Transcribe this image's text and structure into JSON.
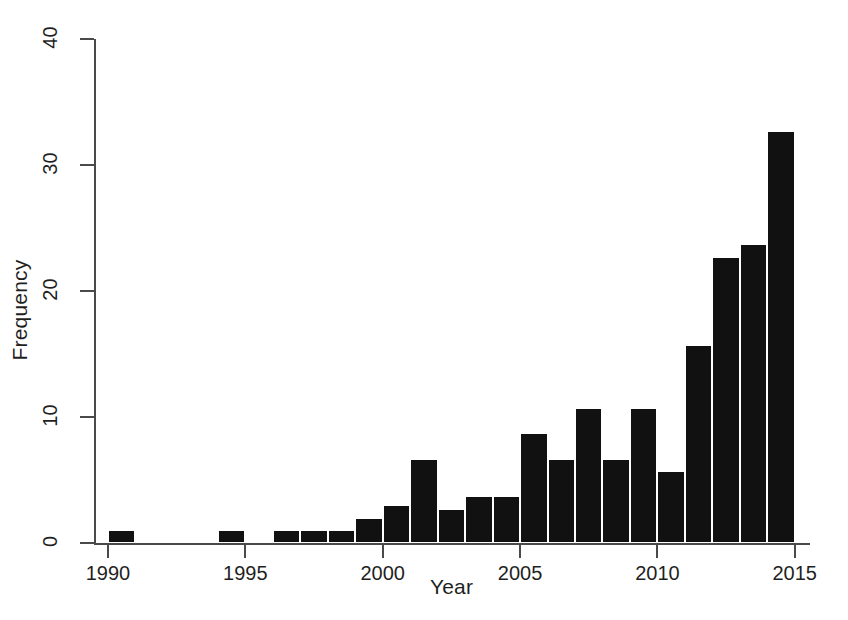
{
  "chart_data": {
    "type": "bar",
    "title": "",
    "xlabel": "Year",
    "ylabel": "Frequency",
    "categories": [
      1990,
      1991,
      1992,
      1993,
      1994,
      1995,
      1996,
      1997,
      1998,
      1999,
      2000,
      2001,
      2002,
      2003,
      2004,
      2005,
      2006,
      2007,
      2008,
      2009,
      2010,
      2011,
      2012,
      2013,
      2014
    ],
    "values": [
      1,
      0,
      0,
      0,
      1,
      0,
      1,
      1,
      1,
      2,
      3,
      6.7,
      2.7,
      3.7,
      3.7,
      8.7,
      6.7,
      10.7,
      6.7,
      10.7,
      5.7,
      15.7,
      22.7,
      23.7,
      32.7
    ],
    "xlim": [
      1989.5,
      2015.5
    ],
    "ylim": [
      0,
      41
    ],
    "xticks": [
      1990,
      1995,
      2000,
      2005,
      2010,
      2015
    ],
    "xtick_labels": [
      "1990",
      "1995",
      "2000",
      "2005",
      "2010",
      "2015"
    ],
    "yticks": [
      0,
      10,
      20,
      30,
      40
    ],
    "ytick_labels": [
      "0",
      "10",
      "20",
      "30",
      "40"
    ],
    "grid": false,
    "legend": null,
    "bar_color": "#111111",
    "axis_color": "#4a4a4a",
    "background": "#ffffff",
    "bar_width_years": 1
  }
}
